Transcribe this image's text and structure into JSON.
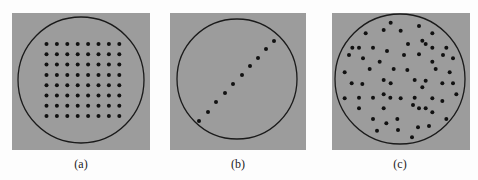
{
  "figure": {
    "panels": [
      {
        "id": "a",
        "label": "(a)",
        "description": "uniform grid sampling",
        "dots_grid": {
          "rows": 8,
          "cols": 8
        }
      },
      {
        "id": "b",
        "label": "(b)",
        "description": "dots along a diagonal line",
        "dot_count": 10
      },
      {
        "id": "c",
        "label": "(c)",
        "description": "random sampling",
        "dot_count": 63
      }
    ],
    "colors": {
      "panel_bg": "#9c9c9c",
      "dot": "#111111",
      "circle": "#1a1a1a",
      "page_bg": "#fdfdfd"
    }
  }
}
